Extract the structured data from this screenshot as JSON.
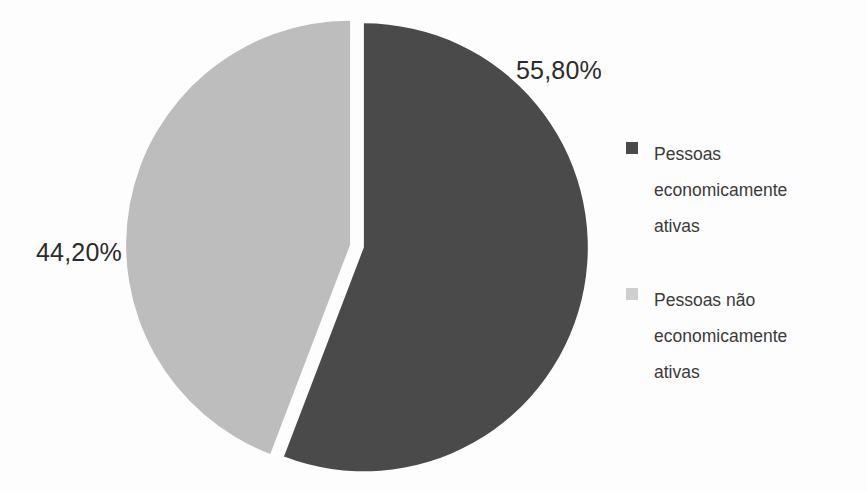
{
  "chart_data": {
    "type": "pie",
    "title": "",
    "categories": [
      "Pessoas economicamente ativas",
      "Pessoas não economicamente ativas"
    ],
    "values": [
      55.8,
      44.2
    ],
    "value_labels": [
      "55,80%",
      "44,20%"
    ],
    "colors": [
      "#4a4a4a",
      "#bdbdbd"
    ],
    "exploded": true,
    "legend_position": "right",
    "grid": false,
    "xlabel": "",
    "ylabel": ""
  },
  "labels": {
    "dark_pct": "55,80%",
    "light_pct": "44,20%"
  },
  "legend": {
    "items": [
      {
        "label": "Pessoas economicamente ativas",
        "color": "#4a4a4a",
        "swatch": "legend-swatch-dark"
      },
      {
        "label": "Pessoas não economicamente ativas",
        "color": "#bdbdbd",
        "swatch": "legend-swatch-light"
      }
    ]
  },
  "colors": {
    "slice_active": "#4a4a4a",
    "slice_inactive": "#bdbdbd",
    "text": "#3a3a3a",
    "label_text": "#2b2b2b",
    "background": "#fdfdfd"
  }
}
